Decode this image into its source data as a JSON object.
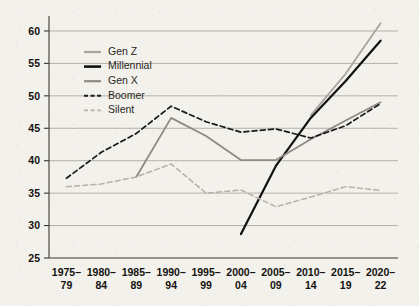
{
  "chart_data": {
    "type": "line",
    "title": "",
    "subtitle": "",
    "xlabel": "",
    "ylabel": "",
    "ylim": [
      25,
      62
    ],
    "yticks": [
      25,
      30,
      35,
      40,
      45,
      50,
      55,
      60
    ],
    "grid": true,
    "legend_position": "upper-left-inside",
    "categories": [
      "1975–\n79",
      "1980–\n84",
      "1985–\n89",
      "1990–\n94",
      "1995–\n99",
      "2000–\n04",
      "2005–\n09",
      "2010–\n14",
      "2015–\n19",
      "2020–\n22"
    ],
    "category_lines": [
      [
        "1975–",
        "79"
      ],
      [
        "1980–",
        "84"
      ],
      [
        "1985–",
        "89"
      ],
      [
        "1990–",
        "94"
      ],
      [
        "1995–",
        "99"
      ],
      [
        "2000–",
        "04"
      ],
      [
        "2005–",
        "09"
      ],
      [
        "2010–",
        "14"
      ],
      [
        "2015–",
        "19"
      ],
      [
        "2020–",
        "22"
      ]
    ],
    "series": [
      {
        "name": "Gen Z",
        "color": "#a8a49c",
        "style": "solid",
        "width": 1.8,
        "values": [
          null,
          null,
          null,
          null,
          null,
          null,
          null,
          47.0,
          53.4,
          61.2
        ]
      },
      {
        "name": "Millennial",
        "color": "#111111",
        "style": "solid",
        "width": 2.2,
        "values": [
          null,
          null,
          null,
          null,
          null,
          28.7,
          39.2,
          46.6,
          52.3,
          58.5
        ]
      },
      {
        "name": "Gen X",
        "color": "#8e8a82",
        "style": "solid",
        "width": 1.8,
        "values": [
          null,
          null,
          37.5,
          46.6,
          43.8,
          40.1,
          40.1,
          43.3,
          46.2,
          49.0
        ]
      },
      {
        "name": "Boomer",
        "color": "#1a1a1a",
        "style": "dashed",
        "width": 1.7,
        "values": [
          37.3,
          41.3,
          44.2,
          48.4,
          46.0,
          44.4,
          44.9,
          43.5,
          45.4,
          48.8
        ]
      },
      {
        "name": "Silent",
        "color": "#b6b2aa",
        "style": "dashed",
        "width": 1.5,
        "values": [
          36.0,
          36.4,
          37.5,
          39.5,
          35.0,
          35.5,
          32.9,
          34.4,
          36.0,
          35.4
        ]
      }
    ]
  },
  "legend": {
    "items": [
      {
        "label": "Gen Z"
      },
      {
        "label": "Millennial"
      },
      {
        "label": "Gen X"
      },
      {
        "label": "Boomer"
      },
      {
        "label": "Silent"
      }
    ]
  }
}
